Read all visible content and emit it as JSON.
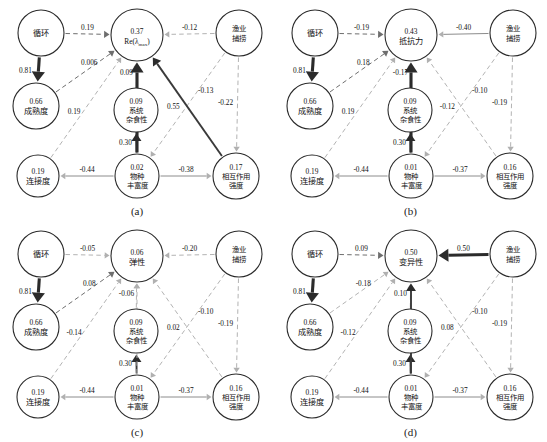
{
  "figure": {
    "type": "path-diagram-grid",
    "panel_count": 4,
    "nodes_common": {
      "cycling": "循环",
      "maturity": "成熟度",
      "connectance": "连接度",
      "omnivory": "系统\n杂食性",
      "omnivory_l1": "系统",
      "omnivory_l2": "杂食性",
      "richness_l1": "物种",
      "richness_l2": "丰富度",
      "fishing_l1": "渔业",
      "fishing_l2": "捕捞",
      "interaction_l1": "相互作用",
      "interaction_l2": "强度"
    }
  },
  "chart_data": {
    "type": "diagram",
    "title": "",
    "panels": [
      {
        "caption": "(a)",
        "response_node": {
          "value": "0.37",
          "label": "Re(λmax)",
          "label_main": "Re(λ",
          "label_sub": "max",
          "label_tail": ")"
        },
        "nodes": [
          {
            "id": "cycling",
            "value": "",
            "label": "循环",
            "value_below": "0.81"
          },
          {
            "id": "maturity",
            "value": "0.66",
            "label": "成熟度"
          },
          {
            "id": "connectance",
            "value": "0.19",
            "label": "连接度"
          },
          {
            "id": "omnivory",
            "value": "0.09",
            "label": "系统杂食性"
          },
          {
            "id": "richness",
            "value": "0.02",
            "label": "物种丰富度"
          },
          {
            "id": "fishing",
            "value": "",
            "label": "渔业捕捞"
          },
          {
            "id": "interaction",
            "value": "0.17",
            "label": "相互作用强度"
          }
        ],
        "edges": [
          {
            "from": "cycling",
            "to": "response",
            "value": "0.19",
            "style": "dashed-dark"
          },
          {
            "from": "cycling",
            "to": "maturity",
            "value": "0.81",
            "style": "solid-thick"
          },
          {
            "from": "maturity",
            "to": "response",
            "value": "0.006",
            "style": "dashed-dark"
          },
          {
            "from": "connectance",
            "to": "response",
            "value": "0.19",
            "style": "dashed-light"
          },
          {
            "from": "omnivory",
            "to": "response",
            "value": "0.09",
            "style": "dashed-light"
          },
          {
            "from": "richness",
            "to": "omnivory",
            "value": "0.30",
            "style": "solid-mid"
          },
          {
            "from": "richness",
            "to": "response",
            "value": "0.35",
            "style": "solid-thick"
          },
          {
            "from": "richness",
            "to": "connectance",
            "value": "-0.44",
            "style": "solid-thin"
          },
          {
            "from": "richness",
            "to": "interaction",
            "value": "-0.38",
            "style": "solid-thin"
          },
          {
            "from": "fishing",
            "to": "response",
            "value": "-0.12",
            "style": "dashed-light"
          },
          {
            "from": "fishing",
            "to": "richness",
            "value": "-0.13",
            "style": "dashed-light"
          },
          {
            "from": "fishing",
            "to": "interaction",
            "value": "-0.22",
            "style": "dashed-light"
          },
          {
            "from": "interaction",
            "to": "response",
            "value": "0.55",
            "style": "solid-mid"
          }
        ]
      },
      {
        "caption": "(b)",
        "response_node": {
          "value": "0.43",
          "label": "抵抗力"
        },
        "nodes": [
          {
            "id": "cycling",
            "value": "",
            "label": "循环",
            "value_below": "0.81"
          },
          {
            "id": "maturity",
            "value": "0.66",
            "label": "成熟度"
          },
          {
            "id": "connectance",
            "value": "0.19",
            "label": "连接度"
          },
          {
            "id": "omnivory",
            "value": "0.09",
            "label": "系统杂食性"
          },
          {
            "id": "richness",
            "value": "0.01",
            "label": "物种丰富度"
          },
          {
            "id": "fishing",
            "value": "",
            "label": "渔业捕捞"
          },
          {
            "id": "interaction",
            "value": "0.16",
            "label": "相互作用强度"
          }
        ],
        "edges": [
          {
            "from": "cycling",
            "to": "response",
            "value": "-0.19",
            "style": "dashed-dark"
          },
          {
            "from": "cycling",
            "to": "maturity",
            "value": "0.81",
            "style": "solid-thick"
          },
          {
            "from": "maturity",
            "to": "response",
            "value": "0.18",
            "style": "dashed-dark"
          },
          {
            "from": "connectance",
            "to": "response",
            "value": "0.19",
            "style": "dashed-light"
          },
          {
            "from": "omnivory",
            "to": "response",
            "value": "-0.17",
            "style": "dashed-light"
          },
          {
            "from": "richness",
            "to": "omnivory",
            "value": "0.30",
            "style": "solid-mid"
          },
          {
            "from": "richness",
            "to": "response",
            "value": "0.53",
            "style": "solid-thick"
          },
          {
            "from": "richness",
            "to": "connectance",
            "value": "-0.44",
            "style": "solid-thin"
          },
          {
            "from": "richness",
            "to": "interaction",
            "value": "-0.37",
            "style": "solid-thin"
          },
          {
            "from": "fishing",
            "to": "response",
            "value": "-0.40",
            "style": "solid-thin"
          },
          {
            "from": "fishing",
            "to": "richness",
            "value": "-0.10",
            "style": "dashed-light"
          },
          {
            "from": "fishing",
            "to": "interaction",
            "value": "-0.19",
            "style": "dashed-light"
          },
          {
            "from": "interaction",
            "to": "response",
            "value": "-0.12",
            "style": "dashed-light"
          }
        ]
      },
      {
        "caption": "(c)",
        "response_node": {
          "value": "0.06",
          "label": "弹性"
        },
        "nodes": [
          {
            "id": "cycling",
            "value": "",
            "label": "循环",
            "value_below": "0.81"
          },
          {
            "id": "maturity",
            "value": "0.66",
            "label": "成熟度"
          },
          {
            "id": "connectance",
            "value": "0.19",
            "label": "连接度"
          },
          {
            "id": "omnivory",
            "value": "0.09",
            "label": "系统杂食性"
          },
          {
            "id": "richness",
            "value": "0.01",
            "label": "物种丰富度"
          },
          {
            "id": "fishing",
            "value": "",
            "label": "渔业捕捞"
          },
          {
            "id": "interaction",
            "value": "0.16",
            "label": "相互作用强度"
          }
        ],
        "edges": [
          {
            "from": "cycling",
            "to": "response",
            "value": "-0.05",
            "style": "dashed-light"
          },
          {
            "from": "cycling",
            "to": "maturity",
            "value": "0.81",
            "style": "solid-thick"
          },
          {
            "from": "maturity",
            "to": "response",
            "value": "0.08",
            "style": "dashed-dark"
          },
          {
            "from": "connectance",
            "to": "response",
            "value": "-0.14",
            "style": "dashed-light"
          },
          {
            "from": "omnivory",
            "to": "response",
            "value": "-0.06",
            "style": "dashed-light"
          },
          {
            "from": "richness",
            "to": "omnivory",
            "value": "0.30",
            "style": "solid-mid"
          },
          {
            "from": "richness",
            "to": "response",
            "value": "-0.12",
            "style": "dashed-light"
          },
          {
            "from": "richness",
            "to": "connectance",
            "value": "-0.44",
            "style": "solid-thin"
          },
          {
            "from": "richness",
            "to": "interaction",
            "value": "-0.37",
            "style": "solid-thin"
          },
          {
            "from": "fishing",
            "to": "response",
            "value": "-0.20",
            "style": "dashed-light"
          },
          {
            "from": "fishing",
            "to": "richness",
            "value": "-0.10",
            "style": "dashed-light"
          },
          {
            "from": "fishing",
            "to": "interaction",
            "value": "-0.19",
            "style": "dashed-light"
          },
          {
            "from": "interaction",
            "to": "response",
            "value": "0.02",
            "style": "dashed-light"
          }
        ]
      },
      {
        "caption": "(d)",
        "response_node": {
          "value": "0.50",
          "label": "变异性"
        },
        "nodes": [
          {
            "id": "cycling",
            "value": "",
            "label": "循环",
            "value_below": "0.81"
          },
          {
            "id": "maturity",
            "value": "0.66",
            "label": "成熟度"
          },
          {
            "id": "connectance",
            "value": "0.19",
            "label": "连接度"
          },
          {
            "id": "omnivory",
            "value": "0.09",
            "label": "系统杂食性"
          },
          {
            "id": "richness",
            "value": "0.01",
            "label": "物种丰富度"
          },
          {
            "id": "fishing",
            "value": "",
            "label": "渔业捕捞"
          },
          {
            "id": "interaction",
            "value": "0.16",
            "label": "相互作用强度"
          }
        ],
        "edges": [
          {
            "from": "cycling",
            "to": "response",
            "value": "0.09",
            "style": "dashed-dark"
          },
          {
            "from": "cycling",
            "to": "maturity",
            "value": "0.81",
            "style": "solid-thick"
          },
          {
            "from": "maturity",
            "to": "response",
            "value": "-0.18",
            "style": "dashed-light"
          },
          {
            "from": "connectance",
            "to": "response",
            "value": "-0.12",
            "style": "dashed-light"
          },
          {
            "from": "omnivory",
            "to": "response",
            "value": "0.10",
            "style": "dashed-light"
          },
          {
            "from": "richness",
            "to": "omnivory",
            "value": "0.30",
            "style": "solid-mid"
          },
          {
            "from": "richness",
            "to": "response",
            "value": "-0.48",
            "style": "solid-mid"
          },
          {
            "from": "richness",
            "to": "connectance",
            "value": "-0.44",
            "style": "solid-thin"
          },
          {
            "from": "richness",
            "to": "interaction",
            "value": "-0.37",
            "style": "solid-thin"
          },
          {
            "from": "fishing",
            "to": "response",
            "value": "0.50",
            "style": "solid-thick"
          },
          {
            "from": "fishing",
            "to": "richness",
            "value": "-0.10",
            "style": "dashed-light"
          },
          {
            "from": "fishing",
            "to": "interaction",
            "value": "-0.19",
            "style": "dashed-light"
          },
          {
            "from": "interaction",
            "to": "response",
            "value": "0.08",
            "style": "dashed-light"
          }
        ]
      }
    ]
  }
}
